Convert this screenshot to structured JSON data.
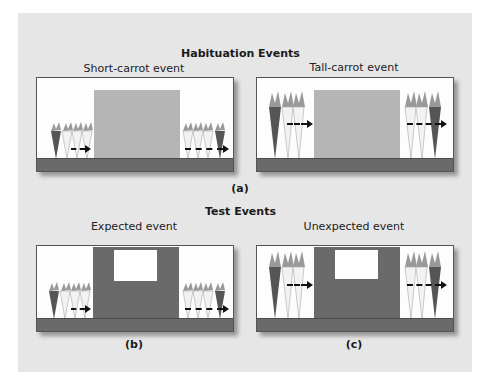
{
  "habituation": {
    "title": "Habituation Events",
    "left_panel": {
      "title": "Short-carrot event",
      "carrot_height": "short"
    },
    "right_panel": {
      "title": "Tall-carrot event",
      "carrot_height": "tall"
    },
    "label": "(a)"
  },
  "test": {
    "title": "Test Events",
    "left_panel": {
      "title": "Expected event",
      "carrot_height": "short",
      "label": "(b)"
    },
    "right_panel": {
      "title": "Unexpected event",
      "carrot_height": "tall",
      "label": "(c)"
    }
  },
  "colors": {
    "background": "#e6e6e6",
    "screen_habituation": "#b5b5b5",
    "screen_test": "#6a6a6a",
    "floor": "#6a6a6a",
    "carrot_dark": "#555555",
    "carrot_light": "#f2f2f2"
  }
}
